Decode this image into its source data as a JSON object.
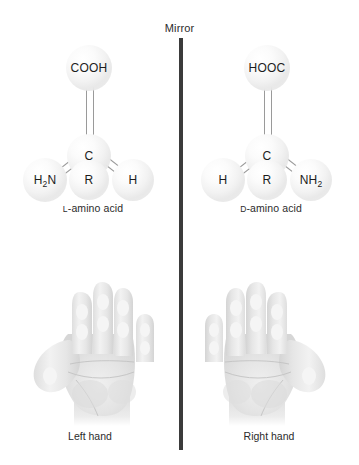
{
  "figure": {
    "mirror_label": "Mirror",
    "mirror_line_color": "#3b3b3b",
    "background_color": "#ffffff",
    "text_color": "#1d1d1d"
  },
  "molecules": {
    "left": {
      "caption_prefix": "L",
      "caption_rest": "-amino acid",
      "atoms": {
        "top": "COOH",
        "center": "C",
        "bottom_left_main": "H",
        "bottom_left_sub": "2",
        "bottom_left_tail": "N",
        "bottom_center": "R",
        "bottom_right": "H"
      }
    },
    "right": {
      "caption_prefix": "D",
      "caption_rest": "-amino acid",
      "atoms": {
        "top": "HOOC",
        "center": "C",
        "bottom_left": "H",
        "bottom_center": "R",
        "bottom_right_main": "NH",
        "bottom_right_sub": "2"
      }
    }
  },
  "hands": {
    "left_label": "Left hand",
    "right_label": "Right hand"
  }
}
